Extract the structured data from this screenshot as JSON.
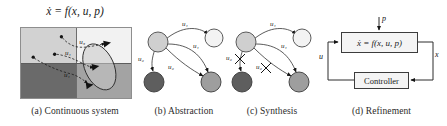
{
  "figure": {
    "title_equation": "ẋ = f(x, u, p)",
    "panel_count": 4
  },
  "panel_a": {
    "caption": "(a) Continuous system",
    "equation": "ẋ = f(x, u, p)",
    "regions": [
      {
        "name": "top-left",
        "fill": "#d2d2d2"
      },
      {
        "name": "top-right",
        "fill": "#f2f2f2"
      },
      {
        "name": "bottom-left",
        "fill": "#6a6a6a"
      },
      {
        "name": "bottom-right",
        "fill": "#a3a3a3"
      }
    ],
    "input_labels": [
      "u₃",
      "u₁",
      "u₁"
    ],
    "label_u3": "u₃",
    "label_u1_mid": "u₁",
    "label_u1_low": "u₁"
  },
  "panel_b": {
    "caption": "(b) Abstraction",
    "nodes": [
      {
        "id": "n-tl",
        "fill": "#cfcfcf"
      },
      {
        "id": "n-tr",
        "fill": "#f3f3f3"
      },
      {
        "id": "n-bl",
        "fill": "#5e5e5e"
      },
      {
        "id": "n-br",
        "fill": "#9e9e9e"
      }
    ],
    "edges": [
      {
        "from": "n-tl",
        "to": "n-tr",
        "label": "u₁"
      },
      {
        "from": "n-tl",
        "to": "n-br",
        "label": "u₁"
      },
      {
        "from": "n-tl",
        "to": "n-bl",
        "label": "u₂"
      },
      {
        "from": "n-tr",
        "to": "n-br",
        "label": "u₂"
      }
    ],
    "label_u1_top": "u₁",
    "label_u1_right": "u₁",
    "label_u2_left": "u₂",
    "label_u2_mid": "u₂"
  },
  "panel_c": {
    "caption": "(c) Synthesis",
    "nodes": [
      {
        "id": "n-tl",
        "fill": "#cfcfcf"
      },
      {
        "id": "n-tr",
        "fill": "#f3f3f3"
      },
      {
        "id": "n-bl",
        "fill": "#5e5e5e"
      },
      {
        "id": "n-br",
        "fill": "#9e9e9e"
      }
    ],
    "edges": [
      {
        "from": "n-tl",
        "to": "n-tr",
        "label": "u₁",
        "removed": false
      },
      {
        "from": "n-tl",
        "to": "n-br",
        "label": "u₁",
        "removed": false
      },
      {
        "from": "n-tl",
        "to": "n-bl",
        "label": "u₂",
        "removed": true
      },
      {
        "from": "n-tr",
        "to": "n-br",
        "label": "u₂",
        "removed": true
      }
    ],
    "label_u1_top": "u₁",
    "label_u1_right": "u₁",
    "label_u2_left": "u₂",
    "label_u2_mid": "u₂"
  },
  "panel_d": {
    "caption": "(d) Refinement",
    "plant_label": "ẋ = f(x, u, p)",
    "controller_label": "Controller",
    "signal_p": "p",
    "signal_x": "x",
    "signal_u": "u"
  },
  "colors": {
    "stroke": "#3c3c3c",
    "node_outline": "#4a4a4a",
    "text": "#1a1a1a"
  }
}
